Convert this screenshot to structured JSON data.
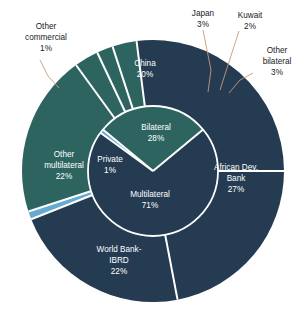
{
  "chart_data": {
    "type": "pie",
    "title": "",
    "subtitle": "",
    "xlabel": "",
    "ylabel": "",
    "legend_position": "none",
    "grid": false,
    "layout": "nested donut: inner ring = creditor category, outer ring = individual creditors",
    "colors": {
      "teal": "#2d6460",
      "navy": "#243b52",
      "light_blue": "#67a9cf",
      "separator": "#ffffff",
      "leader_line": "#c89a78",
      "callout_text": "#1a1a1a",
      "wedge_text": "#ffffff",
      "background": "#ffffff"
    },
    "inner_ring": {
      "name": "Creditor category",
      "categories": [
        "Bilateral",
        "Multilateral",
        "Private"
      ],
      "values": [
        28,
        71,
        1
      ],
      "labels": [
        "Bilateral\n28%",
        "Multilateral\n71%",
        "Private\n1%"
      ],
      "slices": [
        {
          "label": "Bilateral",
          "value": 28,
          "value_text": "28%",
          "color": "#2d6460",
          "label_style": "inside"
        },
        {
          "label": "Multilateral",
          "value": 71,
          "value_text": "71%",
          "color": "#243b52",
          "label_style": "inside"
        },
        {
          "label": "Private",
          "value": 1,
          "value_text": "1%",
          "color": "#67a9cf",
          "label_style": "inside"
        }
      ]
    },
    "outer_ring": {
      "name": "Individual creditors",
      "categories": [
        "China",
        "Japan",
        "Kuwait",
        "Other bilateral",
        "African Dev. Bank",
        "World Bank-IBRD",
        "Other multilateral",
        "Other commercial"
      ],
      "values": [
        20,
        3,
        2,
        3,
        27,
        22,
        22,
        1
      ],
      "slices": [
        {
          "label": "China",
          "value": 20,
          "value_text": "20%",
          "color": "#2d6460",
          "label_style": "inside"
        },
        {
          "label": "Japan",
          "value": 3,
          "value_text": "3%",
          "color": "#2d6460",
          "label_style": "callout"
        },
        {
          "label": "Kuwait",
          "value": 2,
          "value_text": "2%",
          "color": "#2d6460",
          "label_style": "callout"
        },
        {
          "label": "Other bilateral",
          "value": 3,
          "value_text": "3%",
          "color": "#2d6460",
          "label_style": "callout"
        },
        {
          "label": "African Dev. Bank",
          "value": 27,
          "value_text": "27%",
          "color": "#243b52",
          "label_style": "inside"
        },
        {
          "label": "World Bank-IBRD",
          "value": 22,
          "value_text": "22%",
          "color": "#243b52",
          "label_style": "inside"
        },
        {
          "label": "Other multilateral",
          "value": 22,
          "value_text": "22%",
          "color": "#243b52",
          "label_style": "inside"
        },
        {
          "label": "Other commercial",
          "value": 1,
          "value_text": "1%",
          "color": "#67a9cf",
          "label_style": "callout"
        }
      ]
    }
  },
  "labels": {
    "china_name": "China",
    "china_pct": "20%",
    "japan_name": "Japan",
    "japan_pct": "3%",
    "kuwait_name": "Kuwait",
    "kuwait_pct": "2%",
    "other_bilateral_line1": "Other",
    "other_bilateral_line2": "bilateral",
    "other_bilateral_pct": "3%",
    "other_commercial_line1": "Other",
    "other_commercial_line2": "commercial",
    "other_commercial_pct": "1%",
    "african_dev_line1": "African Dev.",
    "african_dev_line2": "Bank",
    "african_dev_pct": "27%",
    "world_bank_line1": "World Bank-",
    "world_bank_line2": "IBRD",
    "world_bank_pct": "22%",
    "other_multilateral_line1": "Other",
    "other_multilateral_line2": "multilateral",
    "other_multilateral_pct": "22%",
    "bilateral_name": "Bilateral",
    "bilateral_pct": "28%",
    "multilateral_name": "Multilateral",
    "multilateral_pct": "71%",
    "private_name": "Private",
    "private_pct": "1%"
  }
}
